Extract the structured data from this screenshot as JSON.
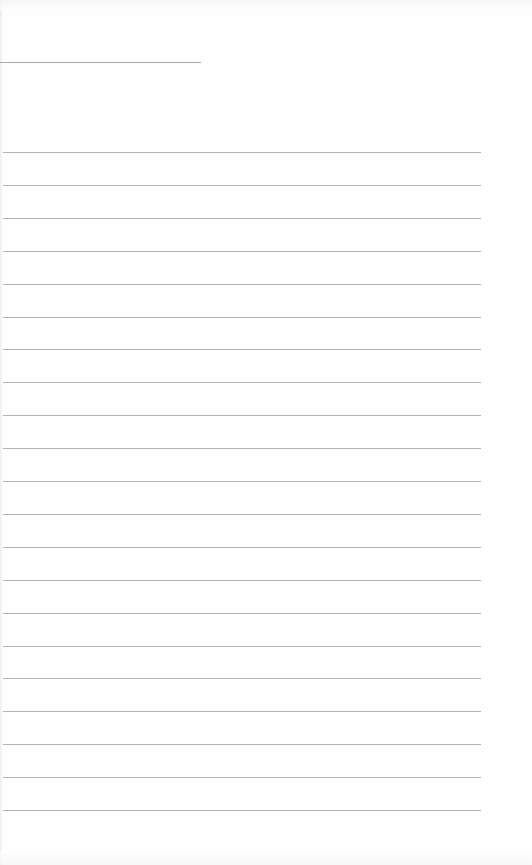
{
  "page": {
    "type": "blank lined notebook page",
    "background_color": "#fefefe",
    "line_color": "#b3b3b3",
    "header_line": {
      "x": 0,
      "y": 62,
      "width": 201
    },
    "ruled_lines": {
      "count": 21,
      "first_y": 152,
      "spacing": 32.9,
      "x_start": 3,
      "x_end": 481
    }
  }
}
